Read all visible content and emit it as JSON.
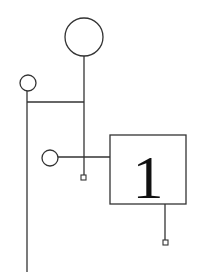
{
  "diagram": {
    "type": "node-link schematic",
    "colors": {
      "stroke": "#333333",
      "background": "#ffffff",
      "text": "#111111"
    },
    "nodes": [
      {
        "id": "large-circle",
        "shape": "circle",
        "cx": 84,
        "cy": 37,
        "r": 19
      },
      {
        "id": "small-circle-top",
        "shape": "circle",
        "cx": 28,
        "cy": 83,
        "r": 8
      },
      {
        "id": "small-circle-middle",
        "shape": "circle",
        "cx": 50,
        "cy": 158,
        "r": 8
      },
      {
        "id": "numbered-box",
        "shape": "rect",
        "x": 110,
        "y": 135,
        "width": 76,
        "height": 69,
        "label": "1"
      },
      {
        "id": "terminal-1",
        "shape": "small-square",
        "cx": 83,
        "cy": 177
      },
      {
        "id": "terminal-2",
        "shape": "small-square",
        "cx": 165,
        "cy": 242
      }
    ],
    "box_label": "1"
  }
}
